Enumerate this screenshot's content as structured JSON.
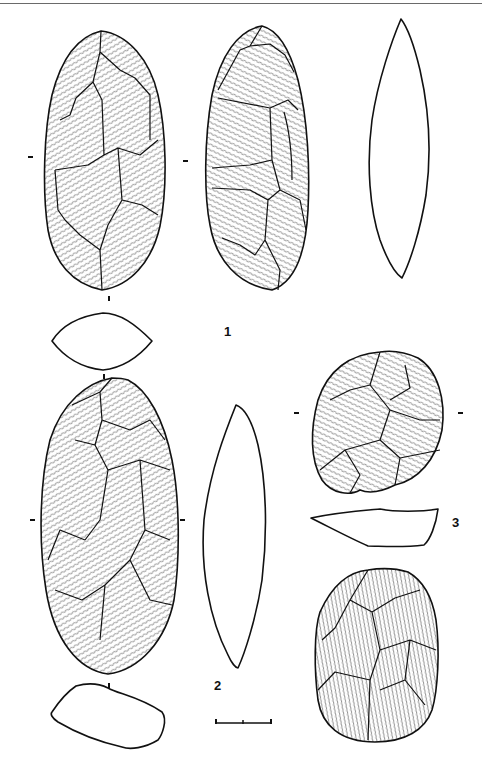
{
  "plate": {
    "description": "Archaeological plate of lithic artifacts (bifaces) with flake-scar drawings and cross-section profiles",
    "figures": [
      {
        "number": "1",
        "views": [
          "face-a",
          "face-b",
          "side-profile",
          "cross-section"
        ]
      },
      {
        "number": "2",
        "views": [
          "face",
          "side-profile",
          "cross-section"
        ]
      },
      {
        "number": "3",
        "views": [
          "face-a",
          "cross-section",
          "face-b"
        ]
      }
    ],
    "labels": {
      "fig1": "1",
      "fig2": "2",
      "fig3": "3"
    },
    "scale_bar": {
      "segments": 2,
      "unit_label": ""
    }
  }
}
